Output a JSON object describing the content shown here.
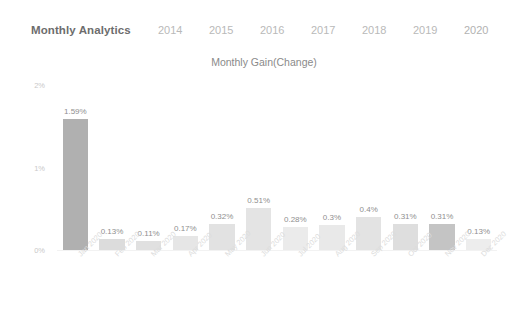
{
  "header": {
    "title": "Monthly Analytics",
    "year_tabs": [
      {
        "label": "2014",
        "active": false
      },
      {
        "label": "2015",
        "active": false
      },
      {
        "label": "2016",
        "active": false
      },
      {
        "label": "2017",
        "active": false
      },
      {
        "label": "2018",
        "active": false
      },
      {
        "label": "2019",
        "active": false
      },
      {
        "label": "2020",
        "active": true
      }
    ]
  },
  "chart_data": {
    "type": "bar",
    "title": "Monthly Gain(Change)",
    "xlabel": "",
    "ylabel": "",
    "ylim": [
      0,
      2
    ],
    "grid": false,
    "legend": "none",
    "ytick_labels": [
      "0%",
      "1%",
      "2%"
    ],
    "ytick_values": [
      0,
      1,
      2
    ],
    "categories": [
      "Jan 2020",
      "Feb 2020",
      "Mar 2020",
      "Apr 2020",
      "May 2020",
      "Jun 2020",
      "Jul 2020",
      "Aug 2020",
      "Sep 2020",
      "Oct 2020",
      "Nov 2020",
      "Dec 2020"
    ],
    "values": [
      1.59,
      0.13,
      0.11,
      0.17,
      0.32,
      0.51,
      0.28,
      0.3,
      0.4,
      0.31,
      0.31,
      0.13
    ],
    "data_labels": [
      "1.59%",
      "0.13%",
      "0.11%",
      "0.17%",
      "0.32%",
      "0.51%",
      "0.28%",
      "0.3%",
      "0.4%",
      "0.31%",
      "0.31%",
      "0.13%"
    ],
    "bar_colors": [
      "#b0b0b0",
      "#dcdcdc",
      "#e0e0e0",
      "#e6e6e6",
      "#e2e2e2",
      "#e4e4e4",
      "#ebebeb",
      "#e9e9e9",
      "#e3e3e3",
      "#dedede",
      "#c4c4c4",
      "#ededed"
    ]
  },
  "colors": {
    "background": "#ffffff",
    "title_text": "#6d6d6d",
    "tab_text": "#b9b9b9",
    "axis_text": "#c9c9c9",
    "xlabel_text": "#dcdcdc",
    "data_label_text": "#8f8f8f"
  }
}
